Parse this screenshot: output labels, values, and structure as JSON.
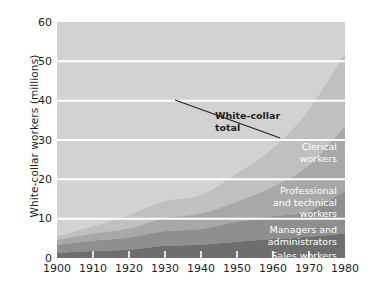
{
  "chart_data": {
    "type": "area",
    "stacked": true,
    "title": "",
    "xlabel": "",
    "ylabel": "White-collar workers (millions)",
    "x": [
      1900,
      1910,
      1920,
      1930,
      1940,
      1950,
      1960,
      1970,
      1980
    ],
    "xlim": [
      1900,
      1980
    ],
    "ylim": [
      0,
      60
    ],
    "xticks": [
      "1900",
      "1910",
      "1920",
      "1930",
      "1940",
      "1950",
      "1960",
      "1970",
      "1980"
    ],
    "yticks": [
      "0",
      "10",
      "20",
      "30",
      "40",
      "50",
      "60"
    ],
    "grid": "horizontal-white",
    "legend": "in-plot labels",
    "series": [
      {
        "name": "Sales workers",
        "color": "#6e6e6e",
        "values": [
          1.3,
          1.8,
          2.1,
          3.1,
          3.4,
          4.1,
          4.8,
          5.4,
          6.2
        ]
      },
      {
        "name": "Managers and administrators",
        "color": "#8f8f8f",
        "values": [
          2.1,
          2.6,
          3.1,
          3.7,
          4.0,
          5.1,
          5.8,
          6.5,
          10.9
        ]
      },
      {
        "name": "Professional and technical workers",
        "color": "#a8a8a8",
        "values": [
          1.2,
          1.8,
          2.3,
          3.3,
          3.9,
          5.1,
          7.5,
          11.6,
          16.4
        ]
      },
      {
        "name": "Clerical workers",
        "color": "#c0c0c0",
        "values": [
          0.9,
          1.9,
          3.4,
          4.3,
          4.7,
          7.2,
          9.8,
          14.2,
          18.6
        ]
      }
    ],
    "totals": [
      5.5,
      8.1,
      10.9,
      14.4,
      16.0,
      21.5,
      27.9,
      37.7,
      52.1
    ],
    "annotations": [
      {
        "name": "white-collar-total",
        "text": "White-collar\ntotal",
        "points_to_year": 1962,
        "points_to_value": 30.5
      }
    ],
    "band_labels": [
      {
        "name": "clerical-workers",
        "text": "Clerical\nworkers"
      },
      {
        "name": "professional-and-technical-workers",
        "text": "Professional\nand technical\nworkers"
      },
      {
        "name": "managers-and-administrators",
        "text": "Managers and\nadministrators"
      },
      {
        "name": "sales-workers",
        "text": "Sales workers"
      }
    ],
    "colors": {
      "plot_background": "#d2d2d2",
      "gridline": "#ffffff",
      "tick": "#ffffff",
      "text": "#231f20",
      "band_label": "#ffffff"
    }
  }
}
